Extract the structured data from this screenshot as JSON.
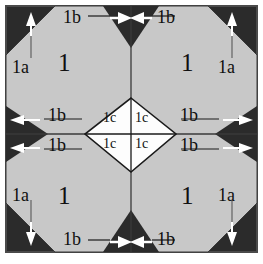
{
  "figure": {
    "type": "geometric-diagram",
    "colors": {
      "page_background": "#ffffff",
      "frame_border": "#4a4a4a",
      "octagon_fill": "#c8c8c8",
      "dark_triangle_fill": "#2b2b2b",
      "diamond_fill": "#fdfdfd",
      "line_color": "#1a1a1a",
      "arrow_white": "#ffffff",
      "arrow_dark": "#1a1a1a",
      "text_color": "#101010"
    },
    "frame": {
      "x": 6,
      "y": 6,
      "width": 251,
      "height": 246
    },
    "labels": {
      "quadrant": "1",
      "corner": "1a",
      "edge": "1b",
      "center": "1c"
    },
    "quadrant_labels": [
      {
        "name": "quadrant-top-left",
        "text": "1",
        "x": 58,
        "y": 50
      },
      {
        "name": "quadrant-top-right",
        "text": "1",
        "x": 181,
        "y": 50
      },
      {
        "name": "quadrant-bottom-left",
        "text": "1",
        "x": 58,
        "y": 183
      },
      {
        "name": "quadrant-bottom-right",
        "text": "1",
        "x": 181,
        "y": 183
      }
    ],
    "corner_labels": [
      {
        "name": "corner-top-left",
        "text": "1a",
        "x": 12,
        "y": 58
      },
      {
        "name": "corner-top-right",
        "text": "1a",
        "x": 218,
        "y": 58
      },
      {
        "name": "corner-bottom-left",
        "text": "1a",
        "x": 12,
        "y": 186
      },
      {
        "name": "corner-bottom-right",
        "text": "1a",
        "x": 218,
        "y": 186
      }
    ],
    "edge_labels": [
      {
        "name": "edge-top-left",
        "text": "1b",
        "x": 63,
        "y": 10
      },
      {
        "name": "edge-top-right",
        "text": "1b",
        "x": 157,
        "y": 10
      },
      {
        "name": "edge-left-upper",
        "text": "1b",
        "x": 48,
        "y": 110
      },
      {
        "name": "edge-left-lower",
        "text": "1b",
        "x": 48,
        "y": 135
      },
      {
        "name": "edge-right-upper",
        "text": "1b",
        "x": 178,
        "y": 110
      },
      {
        "name": "edge-right-lower",
        "text": "1b",
        "x": 178,
        "y": 135
      },
      {
        "name": "edge-bottom-left",
        "text": "1b",
        "x": 63,
        "y": 233
      },
      {
        "name": "edge-bottom-right",
        "text": "1b",
        "x": 157,
        "y": 233
      }
    ],
    "center_labels": [
      {
        "name": "center-upper-left",
        "text": "1c",
        "x": 100,
        "y": 112
      },
      {
        "name": "center-upper-right",
        "text": "1c",
        "x": 134,
        "y": 112
      },
      {
        "name": "center-lower-left",
        "text": "1c",
        "x": 100,
        "y": 137
      },
      {
        "name": "center-lower-right",
        "text": "1c",
        "x": 134,
        "y": 137
      }
    ],
    "arrows": {
      "corner_arrows": [
        {
          "name": "arrow-corner-top-left",
          "direction": "up",
          "color": "#ffffff"
        },
        {
          "name": "arrow-corner-top-right",
          "direction": "up",
          "color": "#ffffff"
        },
        {
          "name": "arrow-corner-bottom-left",
          "direction": "down",
          "color": "#ffffff"
        },
        {
          "name": "arrow-corner-bottom-right",
          "direction": "down",
          "color": "#ffffff"
        }
      ],
      "edge_arrows": [
        {
          "name": "arrow-edge-left-upper",
          "direction": "left",
          "color": "#ffffff"
        },
        {
          "name": "arrow-edge-left-lower",
          "direction": "left",
          "color": "#ffffff"
        },
        {
          "name": "arrow-edge-right-upper",
          "direction": "right",
          "color": "#ffffff"
        },
        {
          "name": "arrow-edge-right-lower",
          "direction": "right",
          "color": "#ffffff"
        },
        {
          "name": "arrow-edge-top-left",
          "direction": "right",
          "color": "#ffffff"
        },
        {
          "name": "arrow-edge-top-right",
          "direction": "left",
          "color": "#ffffff"
        },
        {
          "name": "arrow-edge-bottom-left",
          "direction": "right",
          "color": "#ffffff"
        },
        {
          "name": "arrow-edge-bottom-right",
          "direction": "left",
          "color": "#ffffff"
        }
      ]
    }
  }
}
